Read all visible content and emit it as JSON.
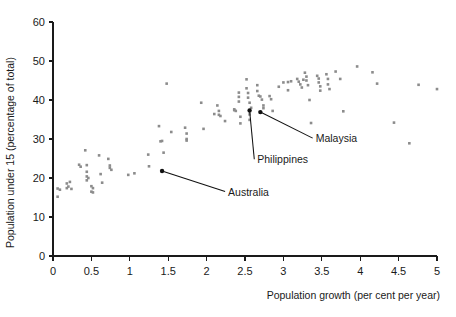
{
  "chart_data": {
    "type": "scatter",
    "title": "",
    "xlabel": "Population growth (per cent per year)",
    "ylabel": "Population under 15 (percentage of total)",
    "xlim": [
      0,
      5
    ],
    "ylim": [
      0,
      60
    ],
    "xticks": [
      "0",
      "0.5",
      "1",
      "1.5",
      "2",
      "2.5",
      "3",
      "3.5",
      "4",
      "4.5",
      "5"
    ],
    "xtick_values": [
      0,
      0.5,
      1,
      1.5,
      2,
      2.5,
      3,
      3.5,
      4,
      4.5,
      5
    ],
    "yticks": [
      "0",
      "10",
      "20",
      "30",
      "40",
      "50",
      "60"
    ],
    "ytick_values": [
      0,
      10,
      20,
      30,
      40,
      50,
      60
    ],
    "grid": false,
    "legend": null,
    "point_color": "#8c8c8c",
    "marked_point_color": "#111111",
    "points": [
      [
        0.06,
        17.3
      ],
      [
        0.06,
        15.2
      ],
      [
        0.09,
        17.0
      ],
      [
        0.18,
        18.6
      ],
      [
        0.18,
        17.4
      ],
      [
        0.2,
        17.8
      ],
      [
        0.22,
        19.0
      ],
      [
        0.24,
        17.2
      ],
      [
        0.34,
        23.4
      ],
      [
        0.36,
        22.9
      ],
      [
        0.42,
        27.1
      ],
      [
        0.44,
        23.3
      ],
      [
        0.44,
        21.6
      ],
      [
        0.44,
        20.4
      ],
      [
        0.44,
        19.4
      ],
      [
        0.46,
        20.0
      ],
      [
        0.5,
        17.9
      ],
      [
        0.5,
        16.5
      ],
      [
        0.52,
        17.4
      ],
      [
        0.52,
        16.3
      ],
      [
        0.6,
        25.8
      ],
      [
        0.62,
        21.0
      ],
      [
        0.64,
        18.8
      ],
      [
        0.72,
        24.9
      ],
      [
        0.74,
        23.2
      ],
      [
        0.74,
        22.6
      ],
      [
        0.76,
        22.1
      ],
      [
        0.98,
        20.8
      ],
      [
        1.06,
        21.2
      ],
      [
        1.24,
        26.0
      ],
      [
        1.25,
        23.0
      ],
      [
        1.38,
        33.3
      ],
      [
        1.4,
        29.4
      ],
      [
        1.42,
        29.5
      ],
      [
        1.44,
        26.5
      ],
      [
        1.48,
        44.2
      ],
      [
        1.54,
        31.8
      ],
      [
        1.72,
        32.9
      ],
      [
        1.74,
        31.4
      ],
      [
        1.74,
        30.0
      ],
      [
        1.74,
        29.6
      ],
      [
        1.93,
        39.3
      ],
      [
        1.96,
        32.6
      ],
      [
        2.1,
        36.4
      ],
      [
        2.14,
        38.6
      ],
      [
        2.16,
        37.2
      ],
      [
        2.16,
        36.2
      ],
      [
        2.18,
        35.9
      ],
      [
        2.24,
        34.6
      ],
      [
        2.36,
        37.6
      ],
      [
        2.36,
        37.4
      ],
      [
        2.38,
        37.2
      ],
      [
        2.42,
        41.9
      ],
      [
        2.42,
        40.8
      ],
      [
        2.42,
        39.6
      ],
      [
        2.44,
        35.7
      ],
      [
        2.44,
        34.0
      ],
      [
        2.52,
        45.3
      ],
      [
        2.52,
        43.0
      ],
      [
        2.54,
        41.8
      ],
      [
        2.54,
        40.6
      ],
      [
        2.56,
        39.3
      ],
      [
        2.58,
        38.0
      ],
      [
        2.56,
        36.3
      ],
      [
        2.56,
        34.9
      ],
      [
        2.66,
        43.8
      ],
      [
        2.66,
        42.3
      ],
      [
        2.68,
        41.1
      ],
      [
        2.7,
        40.9
      ],
      [
        2.72,
        40.1
      ],
      [
        2.74,
        38.6
      ],
      [
        2.74,
        37.9
      ],
      [
        2.82,
        41.0
      ],
      [
        2.84,
        40.2
      ],
      [
        2.86,
        37.2
      ],
      [
        2.94,
        43.4
      ],
      [
        3.0,
        44.5
      ],
      [
        3.06,
        44.6
      ],
      [
        3.06,
        42.5
      ],
      [
        3.1,
        44.8
      ],
      [
        3.18,
        45.4
      ],
      [
        3.2,
        44.7
      ],
      [
        3.22,
        44.0
      ],
      [
        3.24,
        43.2
      ],
      [
        3.26,
        45.2
      ],
      [
        3.28,
        47.0
      ],
      [
        3.3,
        46.0
      ],
      [
        3.3,
        45.0
      ],
      [
        3.32,
        43.8
      ],
      [
        3.34,
        40.0
      ],
      [
        3.36,
        34.1
      ],
      [
        3.44,
        46.2
      ],
      [
        3.46,
        45.5
      ],
      [
        3.46,
        44.5
      ],
      [
        3.48,
        43.5
      ],
      [
        3.48,
        42.4
      ],
      [
        3.56,
        46.6
      ],
      [
        3.58,
        45.4
      ],
      [
        3.58,
        44.0
      ],
      [
        3.6,
        42.8
      ],
      [
        3.68,
        47.3
      ],
      [
        3.74,
        45.4
      ],
      [
        3.78,
        37.1
      ],
      [
        3.96,
        48.6
      ],
      [
        4.16,
        47.1
      ],
      [
        4.22,
        44.2
      ],
      [
        4.44,
        34.2
      ],
      [
        4.64,
        28.9
      ],
      [
        4.76,
        43.9
      ],
      [
        5.0,
        42.8
      ]
    ],
    "annotations": [
      {
        "label": "Australia",
        "point": [
          1.42,
          21.8
        ],
        "text_x": 2.28,
        "text_y": 15.5
      },
      {
        "label": "Philippines",
        "point": [
          2.56,
          37.3
        ],
        "text_x": 2.66,
        "text_y": 23.8
      },
      {
        "label": "Malaysia",
        "point": [
          2.7,
          36.9
        ],
        "text_x": 3.42,
        "text_y": 29.2
      }
    ]
  }
}
